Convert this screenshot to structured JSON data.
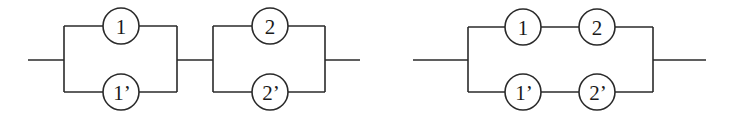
{
  "diagrams": [
    {
      "name": "series-of-parallel",
      "nodes": [
        {
          "id": "n1",
          "label": "1"
        },
        {
          "id": "n1p",
          "label": "1’"
        },
        {
          "id": "n2",
          "label": "2"
        },
        {
          "id": "n2p",
          "label": "2’"
        }
      ]
    },
    {
      "name": "parallel-of-series",
      "nodes": [
        {
          "id": "n1",
          "label": "1"
        },
        {
          "id": "n2",
          "label": "2"
        },
        {
          "id": "n1p",
          "label": "1’"
        },
        {
          "id": "n2p",
          "label": "2’"
        }
      ]
    }
  ],
  "colors": {
    "line": "#2a2a2a",
    "background": "#ffffff"
  }
}
